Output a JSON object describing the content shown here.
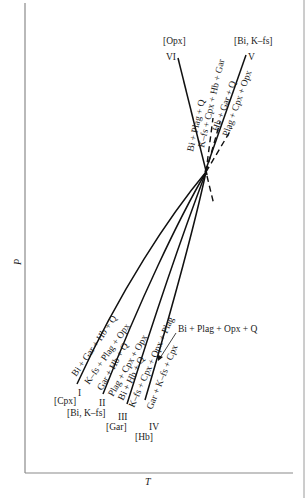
{
  "diagram": {
    "type": "petrogenetic-grid",
    "axes": {
      "x_label": "T",
      "y_label": "P"
    },
    "invariant_point": {
      "x": 206,
      "y": 172
    },
    "reactions": [
      {
        "id": "I",
        "roman": "I",
        "absent_phase": "[Cpx]",
        "upper_assemblage": "Bi + Gar + Hb + Q",
        "lower_assemblage": "K–fs + Plag + Opx"
      },
      {
        "id": "II",
        "roman": "II",
        "absent_phase": "[Bi, K–fs]",
        "upper_assemblage": "Gar + Hb + Q",
        "lower_assemblage": "Plag + Cpx + Opx"
      },
      {
        "id": "III",
        "roman": "III",
        "absent_phase": "[Gar]",
        "upper_assemblage": "Bi + Hb + Q",
        "lower_assemblage": "K–fs + Cpx + Opx + Plag"
      },
      {
        "id": "IV",
        "roman": "IV",
        "absent_phase": "[Hb]",
        "upper_assemblage": "Gar + K–fs + Cpx",
        "lower_assemblage": "Bi + Plag + Opx + Q"
      },
      {
        "id": "V",
        "roman": "V",
        "absent_phase": "[Bi, K–fs]",
        "upper_assemblage": "Hb + Gar + Q",
        "lower_assemblage": "Plag + Cpx + Opx"
      },
      {
        "id": "VI",
        "roman": "VI",
        "absent_phase": "[Opx]",
        "upper_assemblage": "K–fs + Cpx + Hb + Gar",
        "lower_assemblage": "Bi + Plag + Q"
      }
    ]
  }
}
